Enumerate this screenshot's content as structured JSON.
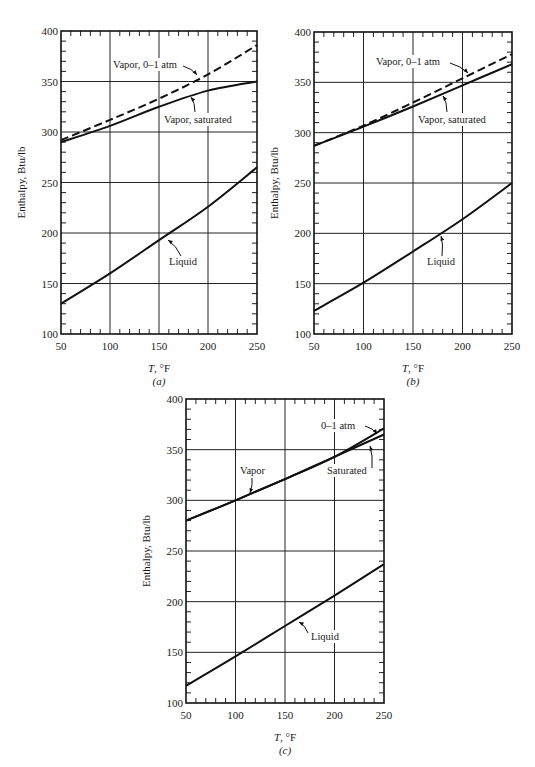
{
  "chart_data": [
    {
      "id": "a",
      "type": "line",
      "caption": "(a)",
      "xlabel": "T, °F",
      "ylabel": "Enthalpy, Btu/lb",
      "xlim": [
        50,
        250
      ],
      "ylim": [
        100,
        400
      ],
      "xticks": [
        50,
        100,
        150,
        200,
        250
      ],
      "yticks": [
        100,
        150,
        200,
        250,
        300,
        350,
        400
      ],
      "grid": true,
      "x": [
        50,
        100,
        150,
        200,
        250
      ],
      "series": [
        {
          "name": "Vapor, 0–1 atm",
          "style": "dashed",
          "values": [
            292,
            312,
            333,
            357,
            386
          ]
        },
        {
          "name": "Vapor, saturated",
          "style": "solid",
          "values": [
            290,
            306,
            325,
            341,
            350
          ]
        },
        {
          "name": "Liquid",
          "style": "solid",
          "values": [
            130,
            160,
            193,
            226,
            265
          ]
        }
      ],
      "annotations": [
        "Vapor, 0–1 atm",
        "Vapor, saturated",
        "Liquid"
      ]
    },
    {
      "id": "b",
      "type": "line",
      "caption": "(b)",
      "xlabel": "T, °F",
      "ylabel": "Enthalpy, Btu/lb",
      "xlim": [
        50,
        250
      ],
      "ylim": [
        100,
        400
      ],
      "xticks": [
        50,
        100,
        150,
        200,
        250
      ],
      "yticks": [
        100,
        150,
        200,
        250,
        300,
        350,
        400
      ],
      "grid": true,
      "x": [
        50,
        100,
        150,
        200,
        250
      ],
      "series": [
        {
          "name": "Vapor, 0–1 atm",
          "style": "dashed",
          "values": [
            287,
            307,
            330,
            354,
            378
          ]
        },
        {
          "name": "Vapor, saturated",
          "style": "solid",
          "values": [
            287,
            306,
            326,
            347,
            368
          ]
        },
        {
          "name": "Liquid",
          "style": "solid",
          "values": [
            123,
            151,
            182,
            214,
            250
          ]
        }
      ],
      "annotations": [
        "Vapor, 0–1 atm",
        "Vapor, saturated",
        "Liquid"
      ]
    },
    {
      "id": "c",
      "type": "line",
      "caption": "(c)",
      "xlabel": "T, °F",
      "ylabel": "Enthalpy, Btu/lb",
      "xlim": [
        50,
        250
      ],
      "ylim": [
        100,
        400
      ],
      "xticks": [
        50,
        100,
        150,
        200,
        250
      ],
      "yticks": [
        100,
        150,
        200,
        250,
        300,
        350,
        400
      ],
      "grid": true,
      "x": [
        50,
        100,
        150,
        200,
        250
      ],
      "series": [
        {
          "name": "Vapor, 0–1 atm",
          "style": "solid",
          "values": [
            280,
            300,
            321,
            343,
            371
          ]
        },
        {
          "name": "Vapor, saturated",
          "style": "solid",
          "values": [
            280,
            300,
            321,
            343,
            365
          ]
        },
        {
          "name": "Liquid",
          "style": "solid",
          "values": [
            117,
            146,
            176,
            206,
            237
          ]
        }
      ],
      "annotations": [
        "Vapor",
        "0–1 atm",
        "Saturated",
        "Liquid"
      ]
    }
  ],
  "panels": [
    {
      "frame": {
        "x0": 61,
        "y0": 31,
        "x1": 257,
        "y1": 334
      },
      "labels": [
        {
          "text": "Vapor, 0–1 atm",
          "x": 113,
          "y": 68,
          "arrow": [
            [
              183,
              66
            ],
            [
              197,
              75
            ]
          ]
        },
        {
          "text": "Vapor, saturated",
          "x": 164,
          "y": 123,
          "arrow": [
            [
              195,
              112
            ],
            [
              191,
              97
            ]
          ]
        },
        {
          "text": "Liquid",
          "x": 169,
          "y": 265,
          "arrow": [
            [
              181,
              256
            ],
            [
              168,
              240
            ]
          ]
        }
      ]
    },
    {
      "frame": {
        "x0": 314,
        "y0": 32,
        "x1": 512,
        "y1": 334
      },
      "labels": [
        {
          "text": "Vapor, 0–1 atm",
          "x": 376,
          "y": 65,
          "arrow": [
            [
              450,
              63
            ],
            [
              468,
              73
            ]
          ]
        },
        {
          "text": "Vapor, saturated",
          "x": 418,
          "y": 123,
          "arrow": [
            [
              447,
              112
            ],
            [
              443,
              96
            ]
          ]
        },
        {
          "text": "Liquid",
          "x": 427,
          "y": 265,
          "arrow": [
            [
              442,
              256
            ],
            [
              441,
              236
            ]
          ]
        }
      ]
    },
    {
      "frame": {
        "x0": 186,
        "y0": 399,
        "x1": 384,
        "y1": 703
      },
      "labels": [
        {
          "text": "0–1 atm",
          "x": 321,
          "y": 429,
          "arrow": [
            [
              365,
              426
            ],
            [
              377,
              434
            ]
          ]
        },
        {
          "text": "Vapor",
          "x": 240,
          "y": 474,
          "arrow": [
            [
              252,
              478
            ],
            [
              250,
              493
            ]
          ]
        },
        {
          "text": "Saturated",
          "x": 327,
          "y": 474,
          "arrow": [
            [
              372,
              468
            ],
            [
              370,
              446
            ]
          ]
        },
        {
          "text": "Liquid",
          "x": 311,
          "y": 640,
          "arrow": [
            [
              308,
              633
            ],
            [
              299,
              622
            ]
          ]
        }
      ]
    }
  ]
}
